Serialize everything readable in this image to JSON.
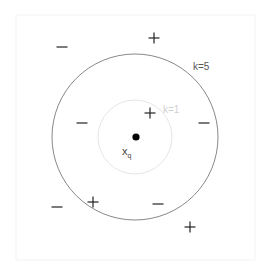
{
  "diagram": {
    "query_label": "x",
    "query_sub": "q",
    "outer_label": "k=5",
    "inner_label": "k=1",
    "colors": {
      "outer": "#777777",
      "inner": "#dddddd",
      "inner_label": "#cccccc",
      "outer_label": "#555555",
      "marks": "#222222",
      "frame": "#f2f2f2"
    },
    "points": [
      {
        "sign": "−",
        "x": 62,
        "y": 47
      },
      {
        "sign": "+",
        "x": 154,
        "y": 38
      },
      {
        "sign": "−",
        "x": 82,
        "y": 123
      },
      {
        "sign": "+",
        "x": 150,
        "y": 113
      },
      {
        "sign": "−",
        "x": 204,
        "y": 123
      },
      {
        "sign": "−",
        "x": 57,
        "y": 207
      },
      {
        "sign": "+",
        "x": 93,
        "y": 202
      },
      {
        "sign": "−",
        "x": 158,
        "y": 204
      },
      {
        "sign": "+",
        "x": 190,
        "y": 227
      }
    ]
  }
}
